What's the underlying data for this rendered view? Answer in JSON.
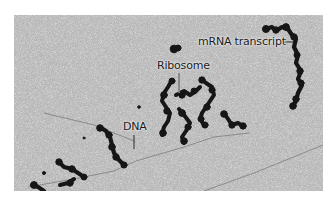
{
  "figure": {
    "type": "electron micrograph",
    "labels": [
      {
        "id": "mrna",
        "text": "mRNA transcript"
      },
      {
        "id": "ribosome",
        "text": "Ribosome"
      },
      {
        "id": "dna",
        "text": "DNA"
      }
    ]
  },
  "colors": {
    "background": "#b9b9b9",
    "blob": "#161616",
    "label_text": "#1a1a1a",
    "page": "#ffffff"
  }
}
